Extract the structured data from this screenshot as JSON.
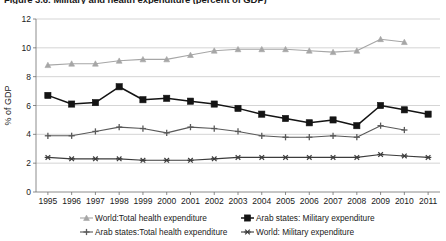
{
  "figure": {
    "title": "Figure 3.6: Military and health expenditure (percent of GDP)"
  },
  "axes": {
    "ylabel": "% of GDP",
    "yticks": [
      "0",
      "2",
      "4",
      "6",
      "8",
      "10",
      "12"
    ],
    "xticks": [
      "1995",
      "1996",
      "1997",
      "1998",
      "1999",
      "2000",
      "2001",
      "2002",
      "2003",
      "2004",
      "2005",
      "2006",
      "2007",
      "2008",
      "2009",
      "2010",
      "2011"
    ]
  },
  "legend": {
    "items": [
      {
        "label": "World:Total health expenditure",
        "marker": "triangle",
        "color": "#a6a6a6"
      },
      {
        "label": "Arab states: Military expenditure",
        "marker": "square",
        "color": "#141414"
      },
      {
        "label": "Arab states:Total health expenditure",
        "marker": "plus",
        "color": "#5a5a5a"
      },
      {
        "label": "World: Military expenditure",
        "marker": "star",
        "color": "#3c3c3c"
      }
    ]
  },
  "chart_data": {
    "type": "line",
    "title": "Figure 3.6: Military and health expenditure (percent of GDP)",
    "xlabel": "",
    "ylabel": "% of GDP",
    "ylim": [
      0,
      12
    ],
    "ytick_step": 2,
    "grid": true,
    "legend_position": "bottom",
    "x": [
      "1995",
      "1996",
      "1997",
      "1998",
      "1999",
      "2000",
      "2001",
      "2002",
      "2003",
      "2004",
      "2005",
      "2006",
      "2007",
      "2008",
      "2009",
      "2010",
      "2011"
    ],
    "series": [
      {
        "name": "World:Total health expenditure",
        "color": "#a6a6a6",
        "marker": "triangle",
        "values": [
          8.8,
          8.9,
          8.9,
          9.1,
          9.2,
          9.2,
          9.5,
          9.8,
          9.9,
          9.9,
          9.9,
          9.8,
          9.7,
          9.8,
          10.6,
          10.4,
          null
        ]
      },
      {
        "name": "Arab states: Military expenditure",
        "color": "#141414",
        "marker": "square",
        "values": [
          6.7,
          6.1,
          6.2,
          7.3,
          6.4,
          6.5,
          6.3,
          6.1,
          5.8,
          5.4,
          5.1,
          4.8,
          5.0,
          4.6,
          6.0,
          5.7,
          5.4
        ]
      },
      {
        "name": "Arab states:Total health expenditure",
        "color": "#5a5a5a",
        "marker": "plus",
        "values": [
          3.9,
          3.9,
          4.2,
          4.5,
          4.4,
          4.1,
          4.5,
          4.4,
          4.2,
          3.9,
          3.8,
          3.8,
          3.9,
          3.8,
          4.6,
          4.3,
          null
        ]
      },
      {
        "name": "World: Military expenditure",
        "color": "#3c3c3c",
        "marker": "star",
        "values": [
          2.4,
          2.3,
          2.3,
          2.3,
          2.2,
          2.2,
          2.2,
          2.3,
          2.4,
          2.4,
          2.4,
          2.4,
          2.4,
          2.4,
          2.6,
          2.5,
          2.4
        ]
      }
    ]
  }
}
